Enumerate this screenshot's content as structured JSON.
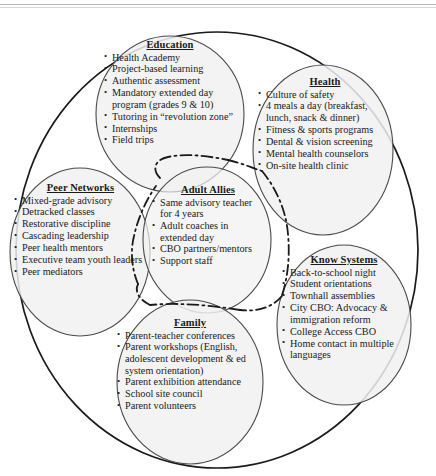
{
  "diagram": {
    "type": "venn-cluster-diagram",
    "outer_boundary": "large enclosing circle",
    "clusters": [
      {
        "id": "education",
        "title": "Education",
        "items": [
          "Health Academy",
          "Project-based learning",
          "Authentic assessment",
          "Mandatory extended day program (grades 9 & 10)",
          "Tutoring in “revolution zone”",
          "Internships",
          "Field trips"
        ]
      },
      {
        "id": "health",
        "title": "Health",
        "items": [
          "Culture of safety",
          "4 meals a day (breakfast, lunch, snack & dinner)",
          "Fitness & sports programs",
          "Dental & vision screening",
          "Mental health counselors",
          "On-site health clinic"
        ]
      },
      {
        "id": "peer_networks",
        "title": "Peer Networks",
        "items": [
          "Mixed-grade advisory",
          "Detracked classes",
          "Restorative discipline",
          "Cascading leadership",
          "Peer health mentors",
          "Executive team youth leaders",
          "Peer mediators"
        ]
      },
      {
        "id": "adult_allies",
        "title": "Adult Allies",
        "items": [
          "Same advisory teacher for 4 years",
          "Adult coaches in extended day",
          "CBO partners/mentors",
          "Support staff"
        ]
      },
      {
        "id": "know_systems",
        "title": "Know Systems",
        "items": [
          "Back-to-school night",
          "Student orientations",
          "Townhall assemblies",
          "City CBO: Advocacy & immigration reform",
          "College Access CBO",
          "Home contact in multiple languages"
        ]
      },
      {
        "id": "family",
        "title": "Family",
        "items": [
          "Parent-teacher conferences",
          "Parent workshops (English, adolescent development & ed system orientation)",
          "Parent exhibition attendance",
          "School site council",
          "Parent volunteers"
        ]
      }
    ],
    "colors": {
      "stroke": "#1a1a1a",
      "cluster_fill": "#f1f1f1",
      "text": "#1a1a1a",
      "background": "#ffffff",
      "scan_rule": "#b9b9b9"
    }
  }
}
